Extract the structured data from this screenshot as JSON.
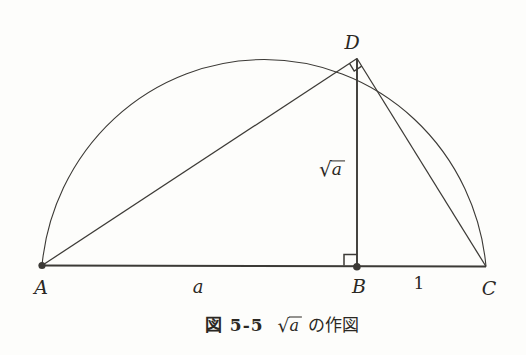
{
  "figure": {
    "points": {
      "A": {
        "label": "A"
      },
      "B": {
        "label": "B"
      },
      "C": {
        "label": "C"
      },
      "D": {
        "label": "D"
      }
    },
    "segment_labels": {
      "ab": "a",
      "bc": "1",
      "bd_radical": "√",
      "bd_radicand": "a"
    },
    "caption": {
      "figure_number": "図 5-5",
      "sqrt_radical": "√",
      "sqrt_radicand": "a",
      "suffix": "の作図"
    },
    "colors": {
      "line": "#3c3a36",
      "paper": "#fdfdfb",
      "ink": "#2b2823"
    }
  }
}
